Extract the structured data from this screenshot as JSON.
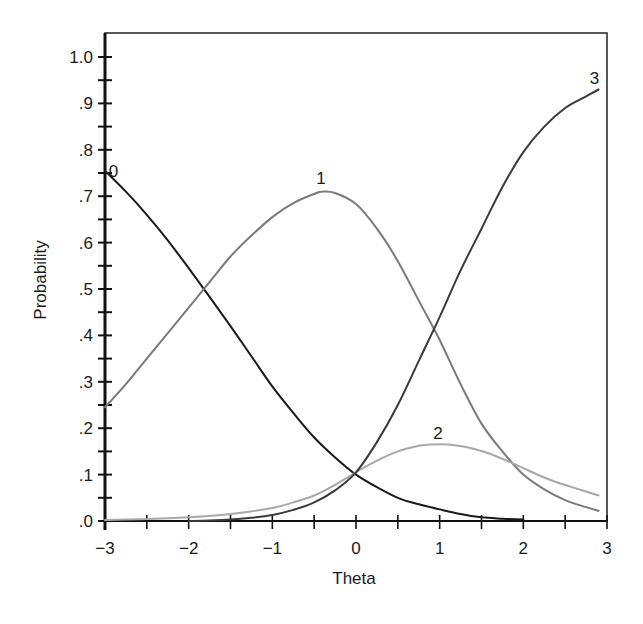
{
  "chart_data": {
    "type": "line",
    "title": "",
    "xlabel": "Theta",
    "ylabel": "Probability",
    "xlim": [
      -3,
      3
    ],
    "ylim": [
      0,
      1.05
    ],
    "grid": false,
    "legend": "none (curves labeled inline)",
    "x_ticks": [
      -3,
      -2,
      -1,
      0,
      1,
      2,
      3
    ],
    "x_tick_labels": [
      "−3",
      "−2",
      "−1",
      "0",
      "1",
      "2",
      "3"
    ],
    "x_minor_ticks": [
      -2.5,
      -1.5,
      -0.5,
      0.5,
      1.5,
      2.5
    ],
    "y_ticks": [
      0,
      0.1,
      0.2,
      0.3,
      0.4,
      0.5,
      0.6,
      0.7,
      0.8,
      0.9,
      1.0
    ],
    "y_tick_labels": [
      ".0",
      ".1",
      ".2",
      ".3",
      ".4",
      ".5",
      ".6",
      ".7",
      ".8",
      ".9",
      "1.0"
    ],
    "y_minor_ticks": [
      0.05,
      0.15,
      0.25,
      0.35,
      0.45,
      0.55,
      0.65,
      0.75,
      0.85,
      0.95
    ],
    "series": [
      {
        "name": "0",
        "label_pos": [
          -2.9,
          0.755
        ],
        "color": "#1a1a1a",
        "width": 2,
        "x": [
          -3,
          -2.75,
          -2.5,
          -2.25,
          -2,
          -1.75,
          -1.5,
          -1.25,
          -1,
          -0.75,
          -0.5,
          -0.25,
          0,
          0.25,
          0.5,
          0.75,
          1,
          1.25,
          1.5,
          1.75,
          2
        ],
        "y": [
          0.755,
          0.71,
          0.66,
          0.605,
          0.545,
          0.483,
          0.42,
          0.355,
          0.29,
          0.233,
          0.18,
          0.137,
          0.1,
          0.073,
          0.05,
          0.036,
          0.025,
          0.015,
          0.008,
          0.005,
          0.003
        ]
      },
      {
        "name": "1",
        "label_pos": [
          -0.42,
          0.74
        ],
        "color": "#7a7a7a",
        "width": 2,
        "x": [
          -3,
          -2.75,
          -2.5,
          -2.25,
          -2,
          -1.75,
          -1.5,
          -1.25,
          -1,
          -0.75,
          -0.5,
          -0.4,
          -0.25,
          0,
          0.25,
          0.5,
          0.75,
          1,
          1.25,
          1.5,
          1.75,
          2,
          2.25,
          2.5,
          2.75,
          2.9
        ],
        "y": [
          0.245,
          0.295,
          0.35,
          0.405,
          0.46,
          0.515,
          0.57,
          0.615,
          0.655,
          0.685,
          0.705,
          0.71,
          0.707,
          0.683,
          0.63,
          0.56,
          0.475,
          0.39,
          0.295,
          0.21,
          0.15,
          0.1,
          0.068,
          0.045,
          0.03,
          0.022
        ]
      },
      {
        "name": "2",
        "label_pos": [
          0.98,
          0.19
        ],
        "color": "#a8a8a8",
        "width": 2,
        "x": [
          -3,
          -2.5,
          -2,
          -1.5,
          -1,
          -0.75,
          -0.5,
          -0.25,
          0,
          0.25,
          0.5,
          0.75,
          0.9,
          1.1,
          1.3,
          1.55,
          1.8,
          2.05,
          2.3,
          2.6,
          2.9
        ],
        "y": [
          0.002,
          0.004,
          0.008,
          0.015,
          0.028,
          0.04,
          0.055,
          0.078,
          0.105,
          0.13,
          0.15,
          0.162,
          0.165,
          0.165,
          0.16,
          0.148,
          0.13,
          0.11,
          0.09,
          0.072,
          0.055
        ]
      },
      {
        "name": "3",
        "label_pos": [
          2.85,
          0.955
        ],
        "color": "#3a3a3a",
        "width": 2,
        "x": [
          -2,
          -1.75,
          -1.5,
          -1.25,
          -1,
          -0.75,
          -0.5,
          -0.25,
          0,
          0.25,
          0.5,
          0.75,
          1,
          1.25,
          1.5,
          1.75,
          2,
          2.25,
          2.5,
          2.75,
          2.9
        ],
        "y": [
          0.0,
          0.001,
          0.003,
          0.007,
          0.013,
          0.024,
          0.04,
          0.066,
          0.105,
          0.17,
          0.25,
          0.345,
          0.44,
          0.54,
          0.63,
          0.72,
          0.795,
          0.85,
          0.89,
          0.915,
          0.93
        ]
      }
    ],
    "annotations": [
      {
        "text": "0",
        "at_curve": "0"
      },
      {
        "text": "1",
        "at_curve": "1"
      },
      {
        "text": "2",
        "at_curve": "2"
      },
      {
        "text": "3",
        "at_curve": "3"
      }
    ]
  }
}
